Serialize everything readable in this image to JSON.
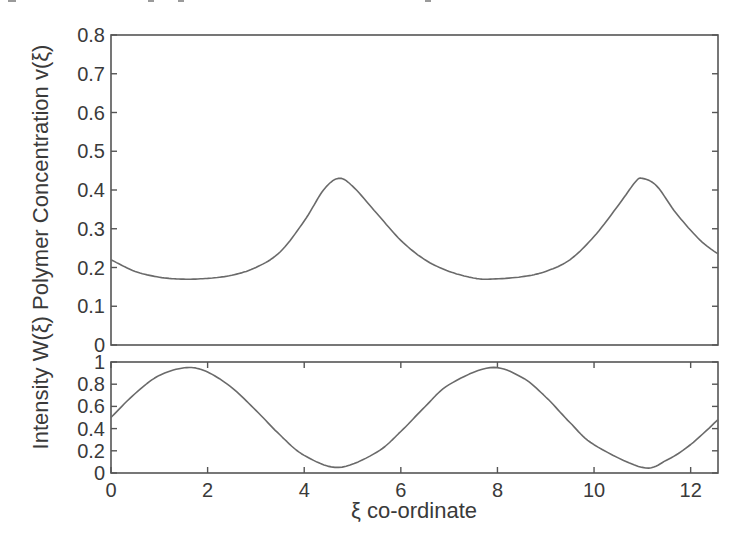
{
  "chart_data": [
    {
      "panel": "top",
      "type": "line",
      "title": "",
      "xlabel": "",
      "ylabel": "Polymer Concentration v(ξ)",
      "xlim": [
        0,
        12.566
      ],
      "ylim": [
        0,
        0.8
      ],
      "grid": false,
      "legend": null,
      "yticks": [
        "0",
        "0.1",
        "0.2",
        "0.3",
        "0.4",
        "0.5",
        "0.6",
        "0.7",
        "0.8"
      ],
      "series": [
        {
          "name": "v(ξ)",
          "x": [
            0,
            0.5,
            1.0,
            1.5,
            2.0,
            2.5,
            3.0,
            3.5,
            4.0,
            4.4,
            4.71,
            5.0,
            5.5,
            6.0,
            6.5,
            7.0,
            7.5,
            7.85,
            8.5,
            9.0,
            9.5,
            10.0,
            10.5,
            10.85,
            11.0,
            11.3,
            11.7,
            12.2,
            12.566
          ],
          "values": [
            0.22,
            0.19,
            0.175,
            0.17,
            0.172,
            0.18,
            0.2,
            0.24,
            0.32,
            0.4,
            0.43,
            0.41,
            0.34,
            0.27,
            0.22,
            0.19,
            0.173,
            0.17,
            0.176,
            0.19,
            0.22,
            0.28,
            0.36,
            0.42,
            0.43,
            0.41,
            0.34,
            0.27,
            0.235
          ]
        }
      ]
    },
    {
      "panel": "bottom",
      "type": "line",
      "title": "",
      "xlabel": "ξ co-ordinate",
      "ylabel": "Intensity W(ξ)",
      "xlim": [
        0,
        12.566
      ],
      "ylim": [
        0,
        1
      ],
      "grid": false,
      "legend": null,
      "xticks": [
        "0",
        "2",
        "4",
        "6",
        "8",
        "10",
        "12"
      ],
      "yticks": [
        "0",
        "0.2",
        "0.4",
        "0.6",
        "0.8",
        "1"
      ],
      "series": [
        {
          "name": "W(ξ)",
          "x": [
            0,
            0.5,
            1.0,
            1.57,
            2.0,
            2.5,
            3.0,
            3.5,
            4.0,
            4.71,
            5.5,
            6.0,
            6.5,
            7.0,
            7.85,
            8.5,
            9.0,
            9.5,
            10.0,
            11.0,
            11.5,
            12.0,
            12.566
          ],
          "values": [
            0.5,
            0.716,
            0.879,
            0.95,
            0.909,
            0.769,
            0.564,
            0.342,
            0.159,
            0.05,
            0.187,
            0.374,
            0.597,
            0.796,
            0.95,
            0.863,
            0.685,
            0.455,
            0.255,
            0.05,
            0.115,
            0.257,
            0.48
          ]
        }
      ]
    }
  ],
  "figure": {
    "ylabel_combined": "Intensity W(ξ) Polymer Concentration v(ξ)",
    "xlabel": "ξ co-ordinate",
    "line_color": "#6a6a6a",
    "axis_color": "#555555"
  }
}
